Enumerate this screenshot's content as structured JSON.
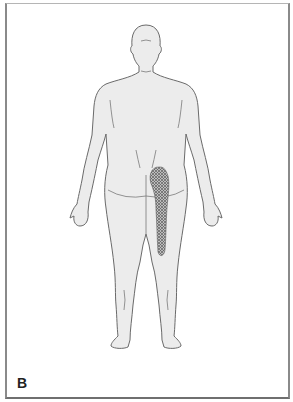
{
  "figure": {
    "panel_label": "B",
    "view": "posterior body outline",
    "body_fill": "#ececec",
    "outline_color": "#6a6a6a",
    "pain_region": {
      "pattern": "crosshatch",
      "location": "left buttock extending down posterior thigh",
      "color": "#7a7a7a"
    }
  }
}
